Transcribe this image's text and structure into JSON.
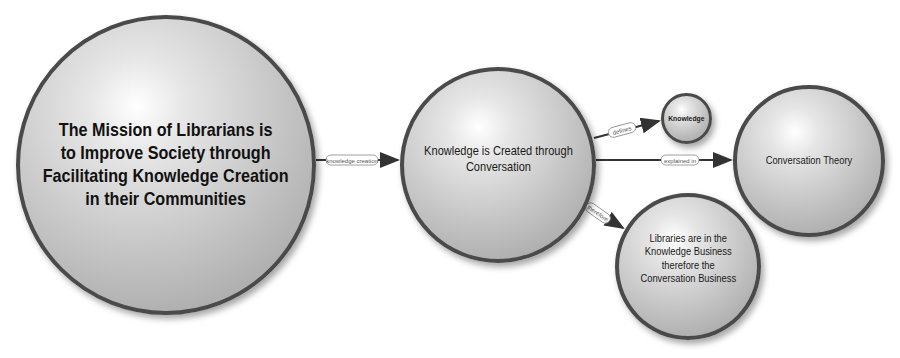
{
  "nodes": [
    {
      "id": "mission",
      "label": "The Mission of Librarians is to Improve Society through Facilitating Knowledge Creation in their Communities",
      "lines": [
        "The Mission of Librarians is",
        "to Improve Society through",
        "Facilitating Knowledge Creation",
        "in their Communities"
      ]
    },
    {
      "id": "created",
      "label": "Knowledge is Created through Conversation",
      "lines": [
        "Knowledge is Created through",
        "Conversation"
      ]
    },
    {
      "id": "knowledge",
      "label": "Knowledge",
      "lines": [
        "Knowledge"
      ]
    },
    {
      "id": "theory",
      "label": "Conversation Theory",
      "lines": [
        "Conversation Theory"
      ]
    },
    {
      "id": "libraries",
      "label": "Libraries are in the Knowledge Business therefore the Conversation Business",
      "lines": [
        "Libraries are in the",
        "Knowledge Business",
        "therefore the",
        "Conversation Business"
      ]
    }
  ],
  "links": [
    {
      "from": "mission",
      "to": "created",
      "label": "knowledge creation"
    },
    {
      "from": "created",
      "to": "knowledge",
      "label": "defines"
    },
    {
      "from": "created",
      "to": "theory",
      "label": "explained in"
    },
    {
      "from": "created",
      "to": "libraries",
      "label": "therefore"
    }
  ],
  "colors": {
    "border": "#4a4a4a",
    "line": "#333333",
    "text": "#1a1a1a"
  }
}
